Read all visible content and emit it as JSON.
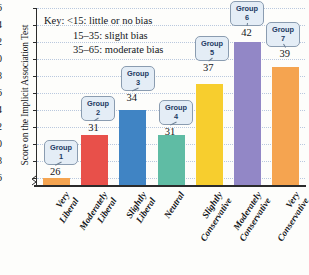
{
  "chart_data": {
    "type": "bar",
    "title": "",
    "xlabel": "",
    "ylabel": "Score on the Implicit Association Test",
    "ylim": [
      25,
      46
    ],
    "yticks": [
      26,
      28,
      30,
      32,
      34,
      36,
      38,
      40,
      42,
      44,
      46
    ],
    "grid": true,
    "axis_break": true,
    "legend_position": "none",
    "categories": [
      "Very Liberal",
      "Moderately Liberal",
      "Slightly Liberal",
      "Neutral",
      "Slightly Conservative",
      "Moderately Conservative",
      "Very Conservative"
    ],
    "category_lines": [
      [
        "Very",
        "Liberal"
      ],
      [
        "Moderately",
        "Liberal"
      ],
      [
        "Slightly",
        "Liberal"
      ],
      [
        "Neutral",
        ""
      ],
      [
        "Slightly",
        "Conservative"
      ],
      [
        "Moderately",
        "Conservative"
      ],
      [
        "Very",
        "Conservative"
      ]
    ],
    "values": [
      26,
      31,
      34,
      31,
      37,
      42,
      39
    ],
    "point_labels": [
      "26",
      "31",
      "34",
      "31",
      "37",
      "42",
      "39"
    ],
    "callouts": [
      {
        "line1": "Group",
        "line2": "1"
      },
      {
        "line1": "Group",
        "line2": "2"
      },
      {
        "line1": "Group",
        "line2": "3"
      },
      {
        "line1": "Group",
        "line2": "4"
      },
      {
        "line1": "Group",
        "line2": "5"
      },
      {
        "line1": "Group",
        "line2": "6"
      },
      {
        "line1": "Group",
        "line2": "7"
      }
    ],
    "colors": [
      "#F5A450",
      "#E8504A",
      "#4084C4",
      "#5FBCA4",
      "#F7CE2E",
      "#9287C6",
      "#F5A450"
    ],
    "annotations": {
      "key_line_1": "Key:  <15: little or no bias",
      "key_line_2": "15–35: slight bias",
      "key_line_3": "35–65: moderate bias"
    }
  },
  "ytick_labels": [
    "46",
    "44",
    "42",
    "40",
    "38",
    "36",
    "34",
    "32",
    "30",
    "28",
    "26"
  ]
}
